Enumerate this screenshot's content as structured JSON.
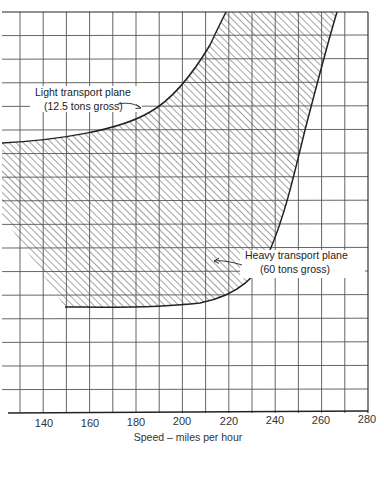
{
  "chart_data": {
    "type": "area",
    "title": "",
    "xlabel": "Speed – miles per hour",
    "ylabel": "",
    "xlim": [
      125,
      280
    ],
    "x_ticks": [
      140,
      160,
      180,
      200,
      220,
      240,
      260,
      280
    ],
    "grid": true,
    "grid_x_step": 10,
    "horizontal_grid_lines": 17,
    "legend": null,
    "series": [
      {
        "name": "Light transport plane (12.5 tons gross)",
        "role": "upper-left boundary of hatched region",
        "points_xy_mph_px": [
          [
            125,
            143
          ],
          [
            140,
            138
          ],
          [
            160,
            125
          ],
          [
            180,
            103
          ],
          [
            200,
            65
          ],
          [
            210,
            38
          ],
          [
            219,
            12
          ]
        ]
      },
      {
        "name": "Heavy transport plane (60 tons gross)",
        "role": "lower-right boundary of hatched region",
        "points_xy_mph_px": [
          [
            150,
            307
          ],
          [
            170,
            304
          ],
          [
            190,
            295
          ],
          [
            205,
            280
          ],
          [
            215,
            255
          ],
          [
            230,
            200
          ],
          [
            245,
            140
          ],
          [
            258,
            70
          ],
          [
            266,
            12
          ]
        ]
      }
    ],
    "shaded_region": "Area between the two curves is diagonally hatched",
    "annotations": [
      {
        "line1": "Light transport plane",
        "line2": "(12.5 tons gross)",
        "points_to": "upper curve near 175 mph"
      },
      {
        "line1": "Heavy transport plane",
        "line2": "(60 tons gross)",
        "points_to": "lower curve near 213 mph"
      }
    ]
  },
  "labels": {
    "x_ticks": [
      "140",
      "160",
      "180",
      "200",
      "220",
      "240",
      "260",
      "280"
    ],
    "x_axis_title": "Speed – miles per hour",
    "light_line1": "Light transport plane",
    "light_line2": "(12.5 tons gross)",
    "heavy_line1": "Heavy transport plane",
    "heavy_line2": "(60 tons gross)"
  },
  "colors": {
    "ink": "#2a2a2a",
    "grid": "#555555",
    "background": "#ffffff"
  }
}
